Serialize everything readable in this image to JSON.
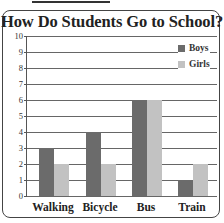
{
  "chart_data": {
    "type": "bar",
    "title": "How Do Students Go to School?",
    "categories": [
      "Walking",
      "Bicycle",
      "Bus",
      "Train"
    ],
    "series": [
      {
        "name": "Boys",
        "values": [
          3,
          4,
          6,
          1
        ],
        "color": "#6b6b6b"
      },
      {
        "name": "Girls",
        "values": [
          2,
          2,
          6,
          2
        ],
        "color": "#c2c2c2"
      }
    ],
    "xlabel": "",
    "ylabel": "",
    "ylim": [
      0,
      10
    ],
    "yticks": [
      "0",
      "1",
      "2",
      "3",
      "4",
      "5",
      "6",
      "7",
      "8",
      "9",
      "10"
    ],
    "grid": true,
    "legend_position": "top-right"
  },
  "title": "How Do Students Go to School?",
  "legend": [
    "Boys",
    "Girls"
  ],
  "categories": [
    "Walking",
    "Bicycle",
    "Bus",
    "Train"
  ],
  "yticks": [
    "0",
    "1",
    "2",
    "3",
    "4",
    "5",
    "6",
    "7",
    "8",
    "9",
    "10"
  ]
}
